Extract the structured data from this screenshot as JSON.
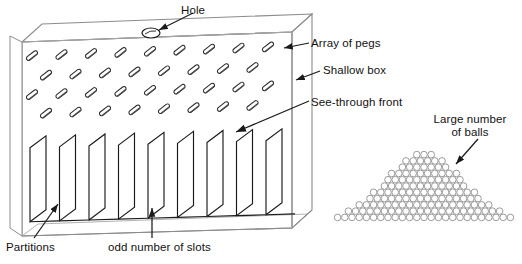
{
  "figure": {
    "width": 522,
    "height": 264,
    "background": "#ffffff",
    "ink_color": "#1a1a1a",
    "edge_color": "#8c8c8c",
    "ball_color": "#9a9a9a"
  },
  "labels": {
    "hole": "Hole",
    "array_of_pegs": "Array of pegs",
    "shallow_box": "Shallow box",
    "see_through_front": "See-through front",
    "large_number_of_balls_line1": "Large number",
    "large_number_of_balls_line2": "of balls",
    "partitions": "Partitions",
    "odd_number_of_slots": "odd number of slots"
  },
  "box": {
    "name": "shallow-box",
    "front_face_corners": "(22,42) (292,32) (292,228) (22,236)",
    "top_face_depth_px": 18,
    "side_face_width_px": 20
  },
  "hole": {
    "name": "hole-on-top-face",
    "cx": 151,
    "cy": 33,
    "rx": 9,
    "ry": 5
  },
  "pegs": {
    "name": "array-of-pegs",
    "tilt_degrees": -38,
    "length_px": 13,
    "thickness_px": 4.2,
    "rows": [
      {
        "count": 9,
        "y": 56,
        "x_start": 32,
        "x_step": 29.5
      },
      {
        "count": 8,
        "y": 76,
        "x_start": 46,
        "x_step": 29.5
      },
      {
        "count": 9,
        "y": 95,
        "x_start": 32,
        "x_step": 29.5
      },
      {
        "count": 8,
        "y": 114,
        "x_start": 46,
        "x_step": 29.5
      }
    ]
  },
  "partitions": {
    "name": "partition-fins",
    "count": 9,
    "x_start": 30,
    "x_step": 29.5,
    "top_y": 148,
    "bottom_y": 222,
    "depth_dx": 16,
    "depth_dy": -12
  },
  "ball_pile": {
    "name": "large-number-of-balls",
    "base_left_x": 334,
    "base_right_x": 519,
    "base_y": 221,
    "peak_x": 424,
    "peak_y": 152,
    "ball_diameter_px": 7.2,
    "approx_ball_count": 430,
    "shape": "bell-curve / normal distribution heap"
  },
  "leaders": [
    {
      "name": "hole-leader",
      "from": "(180,12)",
      "to": "(158,31)"
    },
    {
      "name": "pegs-leader",
      "from": "(308,42)",
      "to": "(283,49)"
    },
    {
      "name": "shallow-box-leader",
      "from": "(318,70)",
      "to": "(295,80)"
    },
    {
      "name": "see-through-leader",
      "from": "(307,101)",
      "to": "(238,131)"
    },
    {
      "name": "balls-leader",
      "from": "(475,140)",
      "to": "(455,163)"
    },
    {
      "name": "partitions-leader",
      "from": "(36,238)",
      "to": "(57,205)"
    },
    {
      "name": "slots-leader",
      "from": "(152,238)",
      "to": "(152,210)"
    }
  ]
}
